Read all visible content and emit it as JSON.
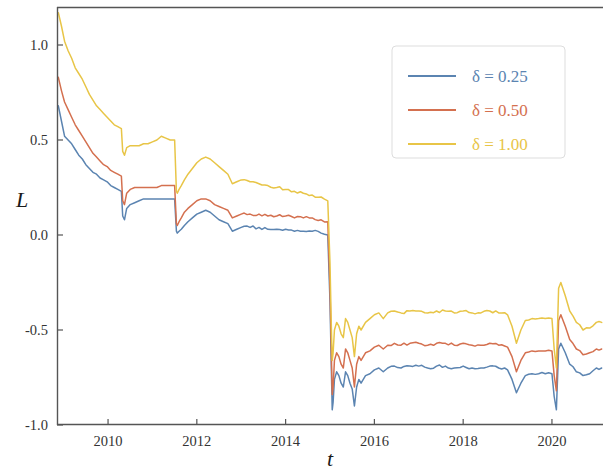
{
  "chart_data": {
    "type": "line",
    "title": "",
    "xlabel": "t",
    "ylabel": "L",
    "xlim": [
      2008.85,
      2021.15
    ],
    "ylim": [
      -1.0,
      1.2
    ],
    "xticks": [
      2010,
      2012,
      2014,
      2016,
      2018,
      2020
    ],
    "xtick_labels": [
      "2010",
      "2012",
      "2014",
      "2016",
      "2018",
      "2020"
    ],
    "yticks": [
      1.0,
      0.5,
      0.0,
      -0.5,
      -1.0
    ],
    "ytick_labels": [
      "1.0",
      "0.5",
      "0.0",
      "-0.5",
      "-1.0"
    ],
    "grid": false,
    "legend_position": "upper right",
    "series": [
      {
        "name": "delta = 0.25",
        "label": "δ = 0.25",
        "color": "#5b84b1",
        "x": [
          2008.88,
          2008.95,
          2009.02,
          2009.1,
          2009.18,
          2009.26,
          2009.34,
          2009.42,
          2009.5,
          2009.58,
          2009.66,
          2009.74,
          2009.82,
          2009.9,
          2009.98,
          2010.06,
          2010.14,
          2010.22,
          2010.3,
          2010.33,
          2010.37,
          2010.42,
          2010.5,
          2010.6,
          2010.7,
          2010.8,
          2010.9,
          2011.0,
          2011.1,
          2011.2,
          2011.3,
          2011.4,
          2011.5,
          2011.54,
          2011.56,
          2011.6,
          2011.65,
          2011.72,
          2011.8,
          2011.9,
          2012.0,
          2012.1,
          2012.2,
          2012.3,
          2012.4,
          2012.5,
          2012.6,
          2012.7,
          2012.8,
          2012.9,
          2013.0,
          2013.2,
          2013.4,
          2013.6,
          2013.8,
          2014.0,
          2014.2,
          2014.4,
          2014.6,
          2014.8,
          2014.95,
          2015.0,
          2015.03,
          2015.05,
          2015.07,
          2015.1,
          2015.15,
          2015.2,
          2015.25,
          2015.3,
          2015.35,
          2015.4,
          2015.45,
          2015.5,
          2015.55,
          2015.6,
          2015.65,
          2015.7,
          2015.8,
          2015.9,
          2016.0,
          2016.1,
          2016.2,
          2016.3,
          2016.45,
          2016.6,
          2016.8,
          2017.0,
          2017.2,
          2017.4,
          2017.6,
          2017.8,
          2018.0,
          2018.2,
          2018.4,
          2018.6,
          2018.8,
          2019.0,
          2019.1,
          2019.2,
          2019.3,
          2019.4,
          2019.55,
          2019.7,
          2019.85,
          2020.0,
          2020.05,
          2020.1,
          2020.15,
          2020.2,
          2020.3,
          2020.4,
          2020.55,
          2020.7,
          2020.85,
          2021.0,
          2021.12
        ],
        "y": [
          0.68,
          0.6,
          0.52,
          0.5,
          0.48,
          0.45,
          0.42,
          0.4,
          0.37,
          0.35,
          0.33,
          0.32,
          0.3,
          0.29,
          0.28,
          0.26,
          0.25,
          0.24,
          0.23,
          0.1,
          0.08,
          0.14,
          0.16,
          0.17,
          0.18,
          0.19,
          0.19,
          0.19,
          0.19,
          0.19,
          0.19,
          0.19,
          0.19,
          0.02,
          0.01,
          0.02,
          0.03,
          0.05,
          0.07,
          0.09,
          0.11,
          0.12,
          0.13,
          0.12,
          0.1,
          0.08,
          0.07,
          0.06,
          0.02,
          0.03,
          0.04,
          0.04,
          0.04,
          0.03,
          0.03,
          0.03,
          0.02,
          0.02,
          0.02,
          0.01,
          0.0,
          -0.35,
          -0.7,
          -0.92,
          -0.88,
          -0.76,
          -0.72,
          -0.74,
          -0.78,
          -0.8,
          -0.72,
          -0.74,
          -0.78,
          -0.81,
          -0.9,
          -0.8,
          -0.76,
          -0.78,
          -0.74,
          -0.73,
          -0.71,
          -0.7,
          -0.72,
          -0.7,
          -0.69,
          -0.7,
          -0.69,
          -0.69,
          -0.7,
          -0.69,
          -0.69,
          -0.7,
          -0.69,
          -0.7,
          -0.7,
          -0.69,
          -0.7,
          -0.71,
          -0.76,
          -0.83,
          -0.78,
          -0.74,
          -0.73,
          -0.73,
          -0.73,
          -0.73,
          -0.85,
          -0.92,
          -0.6,
          -0.57,
          -0.62,
          -0.68,
          -0.72,
          -0.74,
          -0.73,
          -0.7,
          -0.7
        ]
      },
      {
        "name": "delta = 0.50",
        "label": "δ = 0.50",
        "color": "#d4704f",
        "x": [
          2008.88,
          2008.95,
          2009.02,
          2009.1,
          2009.18,
          2009.26,
          2009.34,
          2009.42,
          2009.5,
          2009.58,
          2009.66,
          2009.74,
          2009.82,
          2009.9,
          2009.98,
          2010.06,
          2010.14,
          2010.22,
          2010.3,
          2010.33,
          2010.37,
          2010.42,
          2010.5,
          2010.6,
          2010.7,
          2010.8,
          2010.9,
          2011.0,
          2011.1,
          2011.2,
          2011.3,
          2011.4,
          2011.5,
          2011.54,
          2011.56,
          2011.6,
          2011.65,
          2011.72,
          2011.8,
          2011.9,
          2012.0,
          2012.1,
          2012.2,
          2012.3,
          2012.4,
          2012.5,
          2012.6,
          2012.7,
          2012.8,
          2012.9,
          2013.0,
          2013.2,
          2013.4,
          2013.6,
          2013.8,
          2014.0,
          2014.2,
          2014.4,
          2014.6,
          2014.8,
          2014.95,
          2015.0,
          2015.03,
          2015.05,
          2015.07,
          2015.1,
          2015.15,
          2015.2,
          2015.25,
          2015.3,
          2015.35,
          2015.4,
          2015.45,
          2015.5,
          2015.55,
          2015.6,
          2015.65,
          2015.7,
          2015.8,
          2015.9,
          2016.0,
          2016.1,
          2016.2,
          2016.3,
          2016.45,
          2016.6,
          2016.8,
          2017.0,
          2017.2,
          2017.4,
          2017.6,
          2017.8,
          2018.0,
          2018.2,
          2018.4,
          2018.6,
          2018.8,
          2019.0,
          2019.1,
          2019.2,
          2019.3,
          2019.4,
          2019.55,
          2019.7,
          2019.85,
          2020.0,
          2020.05,
          2020.1,
          2020.15,
          2020.2,
          2020.3,
          2020.4,
          2020.55,
          2020.7,
          2020.85,
          2021.0,
          2021.12
        ],
        "y": [
          0.83,
          0.76,
          0.7,
          0.66,
          0.62,
          0.58,
          0.55,
          0.52,
          0.49,
          0.46,
          0.43,
          0.41,
          0.39,
          0.37,
          0.36,
          0.34,
          0.33,
          0.32,
          0.31,
          0.18,
          0.16,
          0.22,
          0.24,
          0.25,
          0.25,
          0.25,
          0.25,
          0.25,
          0.25,
          0.26,
          0.26,
          0.26,
          0.26,
          0.06,
          0.05,
          0.07,
          0.09,
          0.12,
          0.14,
          0.16,
          0.18,
          0.19,
          0.19,
          0.18,
          0.16,
          0.15,
          0.14,
          0.13,
          0.09,
          0.1,
          0.11,
          0.11,
          0.11,
          0.1,
          0.1,
          0.1,
          0.09,
          0.09,
          0.09,
          0.08,
          0.07,
          -0.28,
          -0.62,
          -0.84,
          -0.8,
          -0.66,
          -0.62,
          -0.64,
          -0.68,
          -0.7,
          -0.6,
          -0.62,
          -0.66,
          -0.7,
          -0.8,
          -0.68,
          -0.64,
          -0.66,
          -0.62,
          -0.61,
          -0.59,
          -0.58,
          -0.6,
          -0.58,
          -0.57,
          -0.58,
          -0.57,
          -0.57,
          -0.58,
          -0.57,
          -0.57,
          -0.58,
          -0.57,
          -0.58,
          -0.58,
          -0.57,
          -0.58,
          -0.59,
          -0.64,
          -0.72,
          -0.66,
          -0.62,
          -0.61,
          -0.61,
          -0.61,
          -0.61,
          -0.74,
          -0.82,
          -0.45,
          -0.42,
          -0.48,
          -0.55,
          -0.6,
          -0.63,
          -0.62,
          -0.6,
          -0.6
        ]
      },
      {
        "name": "delta = 1.00",
        "label": "δ = 1.00",
        "color": "#e8c547",
        "x": [
          2008.88,
          2008.95,
          2009.02,
          2009.1,
          2009.18,
          2009.26,
          2009.34,
          2009.42,
          2009.5,
          2009.58,
          2009.66,
          2009.74,
          2009.82,
          2009.9,
          2009.98,
          2010.06,
          2010.14,
          2010.22,
          2010.3,
          2010.33,
          2010.37,
          2010.42,
          2010.5,
          2010.6,
          2010.7,
          2010.8,
          2010.9,
          2011.0,
          2011.1,
          2011.2,
          2011.3,
          2011.4,
          2011.5,
          2011.54,
          2011.56,
          2011.6,
          2011.65,
          2011.72,
          2011.8,
          2011.9,
          2012.0,
          2012.1,
          2012.2,
          2012.3,
          2012.4,
          2012.5,
          2012.6,
          2012.7,
          2012.8,
          2012.9,
          2013.0,
          2013.2,
          2013.4,
          2013.6,
          2013.8,
          2014.0,
          2014.2,
          2014.4,
          2014.6,
          2014.8,
          2014.95,
          2015.0,
          2015.03,
          2015.05,
          2015.07,
          2015.1,
          2015.15,
          2015.2,
          2015.25,
          2015.3,
          2015.35,
          2015.4,
          2015.45,
          2015.5,
          2015.55,
          2015.6,
          2015.65,
          2015.7,
          2015.8,
          2015.9,
          2016.0,
          2016.1,
          2016.2,
          2016.3,
          2016.45,
          2016.6,
          2016.8,
          2017.0,
          2017.2,
          2017.4,
          2017.6,
          2017.8,
          2018.0,
          2018.2,
          2018.4,
          2018.6,
          2018.8,
          2019.0,
          2019.1,
          2019.2,
          2019.3,
          2019.4,
          2019.55,
          2019.7,
          2019.85,
          2020.0,
          2020.05,
          2020.1,
          2020.15,
          2020.2,
          2020.3,
          2020.4,
          2020.55,
          2020.7,
          2020.85,
          2021.0,
          2021.12
        ],
        "y": [
          1.17,
          1.1,
          1.02,
          0.97,
          0.93,
          0.88,
          0.85,
          0.82,
          0.78,
          0.74,
          0.71,
          0.68,
          0.66,
          0.64,
          0.62,
          0.6,
          0.58,
          0.57,
          0.56,
          0.44,
          0.42,
          0.46,
          0.47,
          0.47,
          0.47,
          0.48,
          0.48,
          0.49,
          0.5,
          0.52,
          0.51,
          0.5,
          0.5,
          0.23,
          0.22,
          0.24,
          0.26,
          0.29,
          0.32,
          0.35,
          0.38,
          0.4,
          0.41,
          0.4,
          0.38,
          0.36,
          0.34,
          0.32,
          0.27,
          0.28,
          0.29,
          0.28,
          0.27,
          0.26,
          0.25,
          0.24,
          0.23,
          0.22,
          0.21,
          0.2,
          0.18,
          -0.15,
          -0.48,
          -0.66,
          -0.62,
          -0.5,
          -0.46,
          -0.48,
          -0.52,
          -0.54,
          -0.44,
          -0.46,
          -0.5,
          -0.54,
          -0.64,
          -0.52,
          -0.48,
          -0.5,
          -0.46,
          -0.44,
          -0.42,
          -0.41,
          -0.44,
          -0.41,
          -0.4,
          -0.41,
          -0.4,
          -0.4,
          -0.41,
          -0.4,
          -0.4,
          -0.41,
          -0.4,
          -0.41,
          -0.41,
          -0.4,
          -0.41,
          -0.42,
          -0.48,
          -0.57,
          -0.5,
          -0.45,
          -0.44,
          -0.44,
          -0.44,
          -0.44,
          -0.6,
          -0.7,
          -0.28,
          -0.25,
          -0.32,
          -0.4,
          -0.46,
          -0.5,
          -0.49,
          -0.46,
          -0.46
        ]
      }
    ]
  },
  "legend": {
    "entries": [
      {
        "label": "δ = 0.25",
        "color": "#5b84b1"
      },
      {
        "label": "δ = 0.50",
        "color": "#d4704f"
      },
      {
        "label": "δ = 1.00",
        "color": "#e8c547"
      }
    ]
  },
  "axes": {
    "y_label": "L",
    "x_label": "t"
  }
}
